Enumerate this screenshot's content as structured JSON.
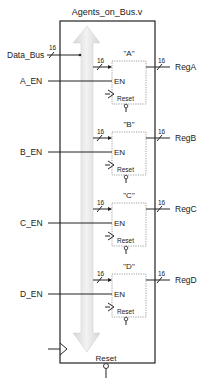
{
  "module": {
    "title": "Agents_on_Bus.v",
    "reset_label": "Reset"
  },
  "inputs": {
    "data_bus": {
      "label": "Data_Bus",
      "width": "16"
    }
  },
  "registers": [
    {
      "name": "\"A\"",
      "enable_label": "A_EN",
      "output_label": "RegA",
      "in_width": "16",
      "out_width": "16",
      "en_pin": "EN",
      "reset_pin": "Reset"
    },
    {
      "name": "\"B\"",
      "enable_label": "B_EN",
      "output_label": "RegB",
      "in_width": "16",
      "out_width": "16",
      "en_pin": "EN",
      "reset_pin": "Reset"
    },
    {
      "name": "\"C\"",
      "enable_label": "C_EN",
      "output_label": "RegC",
      "in_width": "16",
      "out_width": "16",
      "en_pin": "EN",
      "reset_pin": "Reset"
    },
    {
      "name": "\"D\"",
      "enable_label": "D_EN",
      "output_label": "RegD",
      "in_width": "16",
      "out_width": "16",
      "en_pin": "EN",
      "reset_pin": "Reset"
    }
  ],
  "colors": {
    "line": "#222222",
    "arrow_fill": "#ececec",
    "arrow_edge": "#d0d0d0",
    "dotted_box": "#888888"
  }
}
